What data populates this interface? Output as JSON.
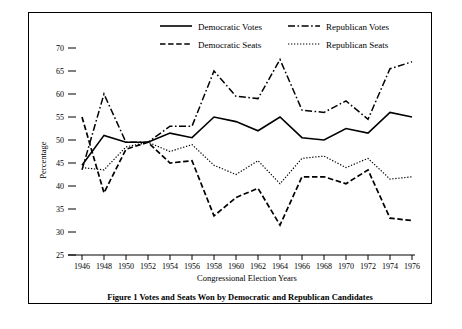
{
  "figure": {
    "caption": "Figure 1 Votes and Seats Won by Democratic and Republican Candidates",
    "xlabel": "Congressional Election Years",
    "ylabel": "Percentage"
  },
  "legend": {
    "items": [
      {
        "label": "Democratic Votes",
        "style": "solid"
      },
      {
        "label": "Republican Votes",
        "style": "dash-dot"
      },
      {
        "label": "Democratic Seats",
        "style": "dashed"
      },
      {
        "label": "Republican Seats",
        "style": "dotted"
      }
    ]
  },
  "chart_data": {
    "type": "line",
    "title": "Figure 1 Votes and Seats Won by Democratic and Republican Candidates",
    "xlabel": "Congressional Election Years",
    "ylabel": "Percentage",
    "grid": false,
    "legend_position": "top-center",
    "x": [
      1946,
      1948,
      1950,
      1952,
      1954,
      1956,
      1958,
      1960,
      1962,
      1964,
      1966,
      1968,
      1970,
      1972,
      1974,
      1976
    ],
    "xticklabels": [
      "1946",
      "1948",
      "1950",
      "1952",
      "1954",
      "1956",
      "1958",
      "1960",
      "1962",
      "1964",
      "1966",
      "1968",
      "1970",
      "1972",
      "1974",
      "1976"
    ],
    "xlim": [
      1946,
      1976
    ],
    "ylim": [
      25,
      70
    ],
    "yticks": [
      25,
      30,
      35,
      40,
      45,
      50,
      55,
      60,
      65,
      70
    ],
    "yticklabels": [
      "25",
      "30",
      "35",
      "40",
      "45",
      "50",
      "55",
      "60",
      "65",
      "70"
    ],
    "series": [
      {
        "name": "Democratic Votes",
        "style": "solid",
        "values": [
          44.5,
          51.0,
          49.5,
          49.5,
          51.5,
          50.5,
          55.0,
          54.0,
          52.0,
          55.0,
          50.5,
          50.0,
          52.5,
          51.5,
          56.0,
          55.0
        ]
      },
      {
        "name": "Republican Votes",
        "style": "dash-dot",
        "values": [
          43.5,
          60.0,
          49.5,
          49.5,
          53.0,
          53.0,
          65.0,
          59.5,
          59.0,
          67.5,
          56.5,
          56.0,
          58.5,
          54.5,
          65.5,
          67.0
        ]
      },
      {
        "name": "Democratic Seats",
        "style": "dashed",
        "values": [
          55.0,
          38.5,
          48.0,
          49.5,
          45.0,
          45.5,
          33.5,
          37.5,
          39.5,
          31.5,
          42.0,
          42.0,
          40.5,
          43.5,
          33.0,
          32.5
        ]
      },
      {
        "name": "Republican Seats",
        "style": "dotted",
        "values": [
          44.0,
          43.5,
          48.5,
          49.5,
          47.5,
          49.0,
          44.5,
          42.5,
          45.5,
          40.5,
          46.0,
          46.5,
          44.0,
          46.0,
          41.5,
          42.0
        ]
      }
    ]
  }
}
